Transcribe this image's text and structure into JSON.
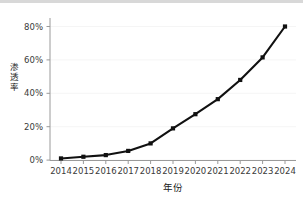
{
  "chart_data": {
    "type": "line",
    "title": "",
    "xlabel": "年份",
    "ylabel": "渗透率",
    "categories": [
      "2014",
      "2015",
      "2016",
      "2017",
      "2018",
      "2019",
      "2020",
      "2021",
      "2022",
      "2023",
      "2024"
    ],
    "x": [
      2014,
      2015,
      2016,
      2017,
      2018,
      2019,
      2020,
      2021,
      2022,
      2023,
      2024
    ],
    "values": [
      1,
      2,
      3,
      5.5,
      10,
      19,
      27.5,
      36.5,
      48,
      61.5,
      80
    ],
    "series": [
      {
        "name": "渗透率",
        "values": [
          1,
          2,
          3,
          5.5,
          10,
          19,
          27.5,
          36.5,
          48,
          61.5,
          80
        ]
      }
    ],
    "ylim": [
      0,
      85
    ],
    "xlim": [
      2013.5,
      2024.5
    ],
    "ytick_values": [
      0,
      20,
      40,
      60,
      80
    ],
    "ytick_labels": [
      "0%",
      "20%",
      "40%",
      "60%",
      "80%"
    ],
    "xtick_labels": [
      "2014",
      "2015",
      "2016",
      "2017",
      "2018",
      "2019",
      "2020",
      "2021",
      "2022",
      "2023",
      "2024"
    ],
    "grid": true,
    "legend": false,
    "marker": "square",
    "line_color": "#111111",
    "marker_color": "#111111",
    "grid_color": "#f2f2f2",
    "axis_color": "#9a9a9a",
    "background_color": "#ffffff"
  },
  "ylabel_chars": [
    "渗",
    "透",
    "率"
  ]
}
